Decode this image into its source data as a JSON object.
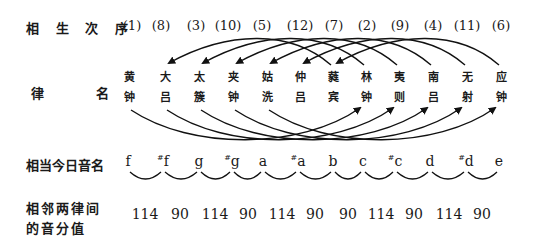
{
  "labels": {
    "sequence": "相 生 次 序",
    "lu_name_left": "律",
    "lu_name_right": "名",
    "modern_note": "相当今日音名",
    "cents_line1": "相邻两律间",
    "cents_line2": "的音分值"
  },
  "sequence_numbers": [
    "(1)",
    "(8)",
    "(3)",
    "(10)",
    "(5)",
    "(12)",
    "(7)",
    "(2)",
    "(9)",
    "(4)",
    "(11)",
    "(6)"
  ],
  "lu_names": [
    {
      "top": "黄",
      "bottom": "钟"
    },
    {
      "top": "大",
      "bottom": "吕"
    },
    {
      "top": "太",
      "bottom": "簇"
    },
    {
      "top": "夹",
      "bottom": "钟"
    },
    {
      "top": "姑",
      "bottom": "洗"
    },
    {
      "top": "仲",
      "bottom": "吕"
    },
    {
      "top": "蕤",
      "bottom": "宾"
    },
    {
      "top": "林",
      "bottom": "钟"
    },
    {
      "top": "夷",
      "bottom": "则"
    },
    {
      "top": "南",
      "bottom": "吕"
    },
    {
      "top": "无",
      "bottom": "射"
    },
    {
      "top": "应",
      "bottom": "钟"
    }
  ],
  "notes": [
    {
      "sharp": "",
      "name": "f"
    },
    {
      "sharp": "#",
      "name": "f"
    },
    {
      "sharp": "",
      "name": "g"
    },
    {
      "sharp": "#",
      "name": "g"
    },
    {
      "sharp": "",
      "name": "a"
    },
    {
      "sharp": "#",
      "name": "a"
    },
    {
      "sharp": "",
      "name": "b"
    },
    {
      "sharp": "",
      "name": "c"
    },
    {
      "sharp": "#",
      "name": "c"
    },
    {
      "sharp": "",
      "name": "d"
    },
    {
      "sharp": "#",
      "name": "d"
    },
    {
      "sharp": "",
      "name": "e"
    }
  ],
  "cents": [
    "114",
    "90",
    "114",
    "90",
    "114",
    "90",
    "90",
    "114",
    "90",
    "114",
    "90"
  ],
  "generation_order": [
    "黄钟",
    "林钟",
    "太簇",
    "南吕",
    "姑洗",
    "应钟",
    "蕤宾",
    "大吕",
    "夷则",
    "夹钟",
    "无射",
    "仲吕"
  ],
  "arcs": {
    "lower_upward_right": [
      [
        "黄钟",
        "林钟"
      ],
      [
        "大吕",
        "夷则"
      ],
      [
        "太簇",
        "南吕"
      ],
      [
        "夹钟",
        "无射"
      ],
      [
        "姑洗",
        "应钟"
      ]
    ],
    "upper_downward_left": [
      [
        "林钟",
        "太簇"
      ],
      [
        "夷则",
        "夹钟"
      ],
      [
        "南吕",
        "姑洗"
      ],
      [
        "无射",
        "仲吕"
      ],
      [
        "应钟",
        "蕤宾"
      ],
      [
        "蕤宾",
        "大吕"
      ]
    ]
  }
}
